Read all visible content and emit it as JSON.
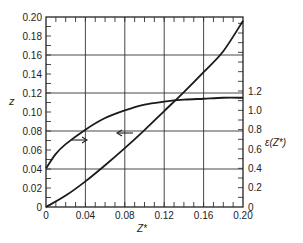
{
  "chart_data": {
    "type": "line",
    "title": "",
    "xlabel": "Z*",
    "ylabel": "z",
    "y2label": "ε(Z*)",
    "xlim": [
      0,
      0.2
    ],
    "ylim": [
      0,
      0.2
    ],
    "y2lim": [
      0,
      1.2
    ],
    "x_ticks": [
      "0",
      "0.04",
      "0.08",
      "0.12",
      "0.16",
      "0.20"
    ],
    "y_ticks": [
      "0",
      "0.02",
      "0.04",
      "0.06",
      "0.08",
      "0.10",
      "0.12",
      "0.14",
      "0.16",
      "0.18",
      "0.20"
    ],
    "y2_ticks": [
      "0",
      "0.2",
      "0.4",
      "0.6",
      "0.8",
      "1.0",
      "1.2"
    ],
    "grid": true,
    "legend": "none (arrows indicate axis association)",
    "series": [
      {
        "name": "z (left axis)",
        "axis": "left",
        "x": [
          0,
          0.02,
          0.04,
          0.06,
          0.08,
          0.1,
          0.12,
          0.14,
          0.16,
          0.18,
          0.2
        ],
        "y": [
          0,
          0.012,
          0.027,
          0.044,
          0.062,
          0.081,
          0.101,
          0.121,
          0.142,
          0.164,
          0.196
        ]
      },
      {
        "name": "ε(Z*) (right axis)",
        "axis": "right",
        "x": [
          0,
          0.01,
          0.02,
          0.04,
          0.06,
          0.08,
          0.1,
          0.12,
          0.14,
          0.16,
          0.18,
          0.2
        ],
        "y": [
          0.4,
          0.55,
          0.65,
          0.8,
          0.92,
          1.0,
          1.06,
          1.09,
          1.11,
          1.12,
          1.13,
          1.13
        ]
      }
    ],
    "annotations": [
      {
        "type": "arrow",
        "direction": "right",
        "near": [
          0.035,
          0.07
        ],
        "meaning": "upper curve reads on right axis ε(Z*)"
      },
      {
        "type": "arrow",
        "direction": "left",
        "near": [
          0.095,
          0.078
        ],
        "meaning": "lower curve reads on left axis z"
      }
    ]
  }
}
